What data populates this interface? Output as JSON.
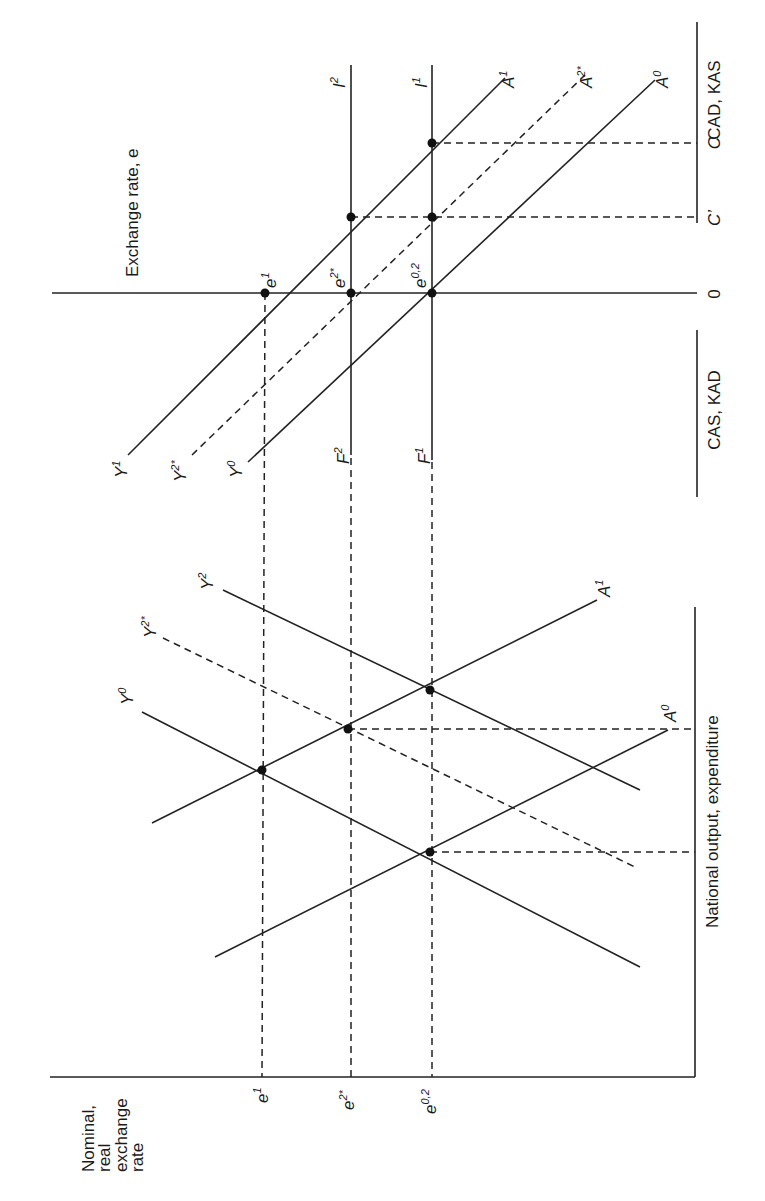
{
  "figure": {
    "top_panel": {
      "vertical_axis_title": "Exchange rate, e",
      "right_axis_title_top": "CAD, KAS",
      "right_axis_title_bottom": "CAS, KAD",
      "right_axis_ticks": [
        "C",
        "C’",
        "0"
      ],
      "vertical_lines": [
        {
          "name": "I",
          "sup": "2"
        },
        {
          "name": "I",
          "sup": "1"
        }
      ],
      "schedules_right": [
        {
          "name": "A",
          "sup": "1",
          "style": "solid"
        },
        {
          "name": "A",
          "sup": "2*",
          "style": "dashed"
        },
        {
          "name": "A",
          "sup": "0",
          "style": "solid"
        }
      ],
      "schedules_left": [
        {
          "name": "Y",
          "sup": "1",
          "style": "solid"
        },
        {
          "name": "Y",
          "sup": "2*",
          "style": "dashed"
        },
        {
          "name": "Y",
          "sup": "0",
          "style": "solid"
        }
      ],
      "lower_line_labels": [
        {
          "name": "F",
          "sup": "2"
        },
        {
          "name": "F",
          "sup": "1"
        }
      ],
      "point_labels": [
        {
          "name": "e",
          "sup": "1"
        },
        {
          "name": "e",
          "sup": "2*"
        },
        {
          "name": "e",
          "sup": "0,2"
        }
      ]
    },
    "bottom_panel": {
      "horizontal_axis_title": "National output, expenditure",
      "vertical_axis_title_lines": [
        "Nominal,",
        "real",
        "exchange",
        "rate"
      ],
      "axis_ticks": [
        {
          "name": "e",
          "sup": "1"
        },
        {
          "name": "e",
          "sup": "2*"
        },
        {
          "name": "e",
          "sup": "0,2"
        }
      ],
      "output_schedules": [
        {
          "name": "Y",
          "sup": "0",
          "style": "solid"
        },
        {
          "name": "Y",
          "sup": "2*",
          "style": "dashed"
        },
        {
          "name": "Y",
          "sup": "2",
          "style": "solid"
        }
      ],
      "expenditure_schedules": [
        {
          "name": "A",
          "sup": "1",
          "style": "solid"
        },
        {
          "name": "A",
          "sup": "0",
          "style": "solid"
        }
      ]
    }
  }
}
